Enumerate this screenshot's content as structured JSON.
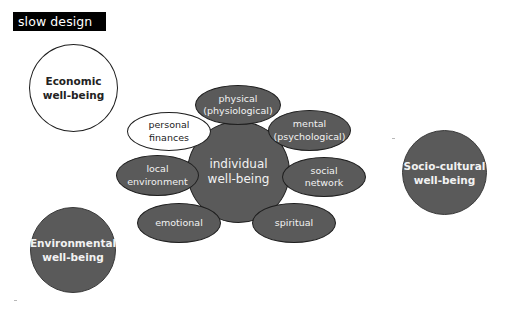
{
  "title": "slow design",
  "colors": {
    "title_bg": "#000000",
    "title_text": "#ffffff",
    "dark_fill": "#5a5a5a",
    "light_fill": "#ffffff",
    "outline": "#1e1e1e"
  },
  "outer_circles": {
    "economic": {
      "line1": "Economic",
      "line2": "well-being",
      "fill": "white"
    },
    "environmental": {
      "line1": "Environmental",
      "line2": "well-being",
      "fill": "dark"
    },
    "socio_cultural": {
      "line1": "Socio-cultural",
      "line2": "well-being",
      "fill": "dark"
    }
  },
  "center": {
    "line1": "individual",
    "line2": "well-being"
  },
  "petals": {
    "physical": {
      "line1": "physical",
      "line2": "(physiological)",
      "fill": "dark"
    },
    "mental": {
      "line1": "mental",
      "line2": "(psychological)",
      "fill": "dark"
    },
    "social": {
      "line1": "social",
      "line2": "network",
      "fill": "dark"
    },
    "spiritual": {
      "line1": "spiritual",
      "fill": "dark"
    },
    "emotional": {
      "line1": "emotional",
      "fill": "dark"
    },
    "local_environment": {
      "line1": "local",
      "line2": "environment",
      "fill": "dark"
    },
    "personal_finances": {
      "line1": "personal",
      "line2": "finances",
      "fill": "white"
    }
  }
}
